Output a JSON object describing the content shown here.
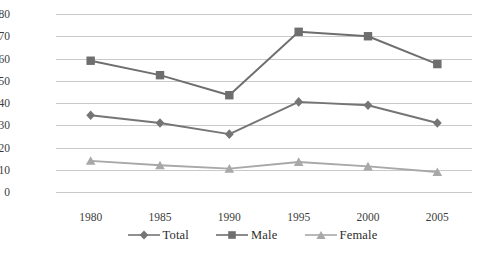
{
  "chart_data": {
    "type": "line",
    "title": "",
    "subtitle": "",
    "xlabel": "",
    "ylabel": "",
    "categories": [
      "1980",
      "1985",
      "1990",
      "1995",
      "2000",
      "2005"
    ],
    "x": [
      1980,
      1985,
      1990,
      1995,
      2000,
      2005
    ],
    "series": [
      {
        "name": "Total",
        "marker": "diamond",
        "color": "#757575",
        "values": [
          34.5,
          31,
          26,
          40.5,
          39,
          31
        ]
      },
      {
        "name": "Male",
        "marker": "square",
        "color": "#6e6e6e",
        "values": [
          59,
          52.5,
          43.5,
          72,
          70,
          57.5
        ]
      },
      {
        "name": "Female",
        "marker": "triangle",
        "color": "#a8a8a8",
        "values": [
          14,
          12,
          10.5,
          13.5,
          11.5,
          9
        ]
      }
    ],
    "ylim": [
      0,
      80
    ],
    "ytick_labels": [
      "0",
      "10",
      "20",
      "30",
      "40",
      "50",
      "60",
      "70",
      "80"
    ],
    "ytick_values": [
      0,
      10,
      20,
      30,
      40,
      50,
      60,
      70,
      80
    ],
    "grid": "horizontal",
    "legend_position": "bottom",
    "plot_background": "#ffffff",
    "gridline_color": "#c9c9c9"
  },
  "axes": {
    "y_ticks": [
      {
        "label": "80",
        "value": 80
      },
      {
        "label": "70",
        "value": 70
      },
      {
        "label": "60",
        "value": 60
      },
      {
        "label": "50",
        "value": 50
      },
      {
        "label": "40",
        "value": 40
      },
      {
        "label": "30",
        "value": 30
      },
      {
        "label": "20",
        "value": 20
      },
      {
        "label": "10",
        "value": 10
      },
      {
        "label": "0",
        "value": 0
      }
    ],
    "x_ticks": [
      {
        "label": "1980"
      },
      {
        "label": "1985"
      },
      {
        "label": "1990"
      },
      {
        "label": "1995"
      },
      {
        "label": "2000"
      },
      {
        "label": "2005"
      }
    ]
  },
  "legend": {
    "entries": [
      {
        "label": "Total",
        "marker": "diamond",
        "color": "#757575"
      },
      {
        "label": "Male",
        "marker": "square",
        "color": "#6e6e6e"
      },
      {
        "label": "Female",
        "marker": "triangle",
        "color": "#a8a8a8"
      }
    ]
  }
}
